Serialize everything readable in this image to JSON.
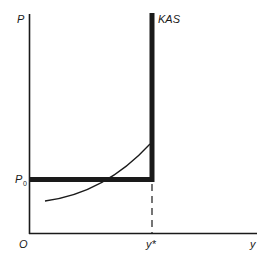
{
  "diagram": {
    "axes": {
      "y_label": "P",
      "x_label": "y",
      "origin_label": "O"
    },
    "price_level": {
      "label": "P",
      "subscript": "0"
    },
    "output_level": {
      "label": "y*"
    },
    "curves": {
      "supply_curve_label": "KAS"
    },
    "colors": {
      "line": "#1a1a1a",
      "background": "#ffffff"
    }
  }
}
